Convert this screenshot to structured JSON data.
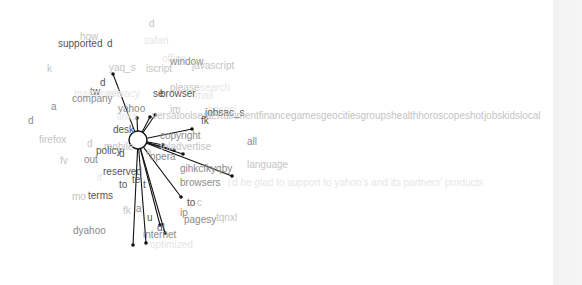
{
  "colors": {
    "dark": "#555555",
    "mid": "#8a8a8a",
    "light": "#c4c4c4",
    "faint": "#e6e6e6",
    "edge": "#111111",
    "strip": "#f3f3f3"
  },
  "center_node": {
    "x": 138,
    "y": 140,
    "r": 9
  },
  "words": [
    {
      "text": "d",
      "x": 149,
      "y": 27,
      "shade": "light"
    },
    {
      "text": "how",
      "x": 80,
      "y": 40,
      "shade": "light"
    },
    {
      "text": "supported",
      "x": 58,
      "y": 47,
      "shade": "dark"
    },
    {
      "text": "d",
      "x": 107,
      "y": 47,
      "shade": "dark"
    },
    {
      "text": "safari",
      "x": 144,
      "y": 44,
      "shade": "faint"
    },
    {
      "text": "office",
      "x": 162,
      "y": 62,
      "shade": "faint"
    },
    {
      "text": "window",
      "x": 170,
      "y": 65,
      "shade": "mid"
    },
    {
      "text": "javascript",
      "x": 192,
      "y": 69,
      "shade": "light"
    },
    {
      "text": "k",
      "x": 47,
      "y": 72,
      "shade": "light"
    },
    {
      "text": "yaq_s",
      "x": 109,
      "y": 71,
      "shade": "light"
    },
    {
      "text": "iscript",
      "x": 146,
      "y": 72,
      "shade": "light"
    },
    {
      "text": "d",
      "x": 100,
      "y": 86,
      "shade": "dark"
    },
    {
      "text": "please",
      "x": 170,
      "y": 91,
      "shade": "light"
    },
    {
      "text": "search",
      "x": 200,
      "y": 91,
      "shade": "faint"
    },
    {
      "text": "tw",
      "x": 90,
      "y": 95,
      "shade": "dark"
    },
    {
      "text": "mailmobile",
      "x": 74,
      "y": 97,
      "shade": "faint"
    },
    {
      "text": "privacy",
      "x": 108,
      "y": 97,
      "shade": "faint"
    },
    {
      "text": "se",
      "x": 153,
      "y": 97,
      "shade": "dark"
    },
    {
      "text": "browser",
      "x": 160,
      "y": 97,
      "shade": "dark"
    },
    {
      "text": "mail",
      "x": 195,
      "y": 99,
      "shade": "faint"
    },
    {
      "text": "company",
      "x": 72,
      "y": 102,
      "shade": "mid"
    },
    {
      "text": "a",
      "x": 51,
      "y": 110,
      "shade": "mid"
    },
    {
      "text": "yahoo",
      "x": 118,
      "y": 112,
      "shade": "mid"
    },
    {
      "text": "im",
      "x": 170,
      "y": 113,
      "shade": "light"
    },
    {
      "text": "sdsocl",
      "x": 208,
      "y": 113,
      "shade": "faint"
    },
    {
      "text": "jobsac_s",
      "x": 205,
      "y": 116,
      "shade": "dark"
    },
    {
      "text": "links",
      "x": 117,
      "y": 120,
      "shade": "faint"
    },
    {
      "text": "versatoolsentertainmentfinancegamesgeocitiesgroupshealthhoroscopeshotjobskidslocal",
      "x": 152,
      "y": 119,
      "shade": "light"
    },
    {
      "text": "fk",
      "x": 201,
      "y": 124,
      "shade": "dark"
    },
    {
      "text": "d",
      "x": 28,
      "y": 124,
      "shade": "mid"
    },
    {
      "text": "desk",
      "x": 113,
      "y": 133,
      "shade": "dark"
    },
    {
      "text": "firefox",
      "x": 39,
      "y": 143,
      "shade": "light"
    },
    {
      "text": "copyright",
      "x": 160,
      "y": 139,
      "shade": "mid"
    },
    {
      "text": "all",
      "x": 247,
      "y": 145,
      "shade": "mid"
    },
    {
      "text": "d",
      "x": 87,
      "y": 147,
      "shade": "light"
    },
    {
      "text": "mobile",
      "x": 104,
      "y": 150,
      "shade": "light"
    },
    {
      "text": "policy",
      "x": 96,
      "y": 154,
      "shade": "dark"
    },
    {
      "text": "d",
      "x": 119,
      "y": 157,
      "shade": "dark"
    },
    {
      "text": "teladvertise",
      "x": 160,
      "y": 150,
      "shade": "light"
    },
    {
      "text": "a",
      "x": 146,
      "y": 155,
      "shade": "light"
    },
    {
      "text": "opera",
      "x": 150,
      "y": 160,
      "shade": "mid"
    },
    {
      "text": "fv",
      "x": 60,
      "y": 164,
      "shade": "light"
    },
    {
      "text": "out",
      "x": 84,
      "y": 163,
      "shade": "mid"
    },
    {
      "text": "gihkcfkyqby",
      "x": 180,
      "y": 172,
      "shade": "mid"
    },
    {
      "text": "language",
      "x": 247,
      "y": 168,
      "shade": "light"
    },
    {
      "text": "reserved",
      "x": 103,
      "y": 175,
      "shade": "dark"
    },
    {
      "text": "if",
      "x": 97,
      "y": 181,
      "shade": "faint"
    },
    {
      "text": "to",
      "x": 119,
      "y": 188,
      "shade": "dark"
    },
    {
      "text": "te",
      "x": 132,
      "y": 183,
      "shade": "dark"
    },
    {
      "text": "t",
      "x": 143,
      "y": 188,
      "shade": "dark"
    },
    {
      "text": "browsers",
      "x": 180,
      "y": 186,
      "shade": "mid"
    },
    {
      "text": "i'd be glad to support to yahoo's and its partners' products",
      "x": 228,
      "y": 186,
      "shade": "faint"
    },
    {
      "text": "mo",
      "x": 72,
      "y": 200,
      "shade": "light"
    },
    {
      "text": "terms",
      "x": 88,
      "y": 199,
      "shade": "dark"
    },
    {
      "text": "to",
      "x": 187,
      "y": 206,
      "shade": "dark"
    },
    {
      "text": "c",
      "x": 197,
      "y": 206,
      "shade": "light"
    },
    {
      "text": "fk",
      "x": 123,
      "y": 214,
      "shade": "light"
    },
    {
      "text": "a",
      "x": 136,
      "y": 212,
      "shade": "mid"
    },
    {
      "text": "ip",
      "x": 180,
      "y": 216,
      "shade": "mid"
    },
    {
      "text": "u",
      "x": 147,
      "y": 221,
      "shade": "dark"
    },
    {
      "text": "pagesy",
      "x": 184,
      "y": 223,
      "shade": "mid"
    },
    {
      "text": "tqnxl",
      "x": 216,
      "y": 221,
      "shade": "light"
    },
    {
      "text": "dyahoo",
      "x": 73,
      "y": 234,
      "shade": "mid"
    },
    {
      "text": "dl",
      "x": 157,
      "y": 231,
      "shade": "dark"
    },
    {
      "text": "internet",
      "x": 143,
      "y": 238,
      "shade": "mid"
    },
    {
      "text": "optimized",
      "x": 150,
      "y": 248,
      "shade": "faint"
    }
  ],
  "edges": [
    {
      "x": 113,
      "y": 74
    },
    {
      "x": 155,
      "y": 115
    },
    {
      "x": 137,
      "y": 118
    },
    {
      "x": 150,
      "y": 117
    },
    {
      "x": 192,
      "y": 129
    },
    {
      "x": 163,
      "y": 145
    },
    {
      "x": 183,
      "y": 154
    },
    {
      "x": 232,
      "y": 176
    },
    {
      "x": 174,
      "y": 150
    },
    {
      "x": 181,
      "y": 197
    },
    {
      "x": 160,
      "y": 225
    },
    {
      "x": 165,
      "y": 233
    },
    {
      "x": 133,
      "y": 245
    },
    {
      "x": 146,
      "y": 243
    }
  ]
}
